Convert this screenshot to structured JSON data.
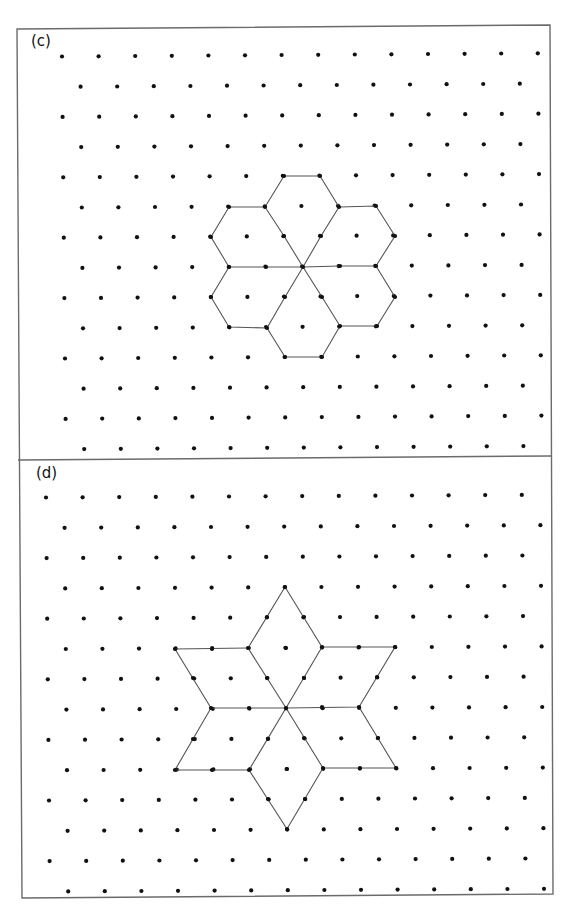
{
  "figure": {
    "border_color": "#6b6b6b",
    "line_color": "#555555",
    "dot_color": "#111111",
    "dot_radius": 2.1,
    "frame": {
      "top_left": [
        17,
        29
      ],
      "top_right": [
        550,
        25
      ],
      "bottom_left": [
        22,
        898
      ],
      "bottom_right": [
        553,
        894
      ],
      "separator": [
        [
          18,
          460
        ],
        [
          551,
          456
        ]
      ]
    }
  },
  "panels": [
    {
      "id": "c",
      "label": "(c)",
      "label_pos": [
        31,
        34
      ],
      "grid": {
        "origin": [
          62,
          56.5
        ],
        "dx": 36.6,
        "dy": 30.2,
        "row_shift": 18.3,
        "drift_x_per_row": 0.3,
        "drift_y_per_col": -0.25,
        "rows": 14,
        "even_cols": 14,
        "odd_cols": 13
      },
      "shape": {
        "name": "six-hexagon-rosette",
        "center": [
          303,
          267
        ],
        "polylines": [
          [
            [
              303,
              267
            ],
            [
              266,
              267
            ],
            [
              229,
              267
            ],
            [
              211,
              237
            ],
            [
              229,
              207
            ],
            [
              265,
              207
            ],
            [
              284,
              236
            ],
            [
              303,
              267
            ]
          ],
          [
            [
              265,
              207
            ],
            [
              284,
              176
            ],
            [
              320,
              176
            ],
            [
              339,
              207
            ],
            [
              321,
              236
            ],
            [
              303,
              267
            ]
          ],
          [
            [
              339,
              207
            ],
            [
              376,
              206
            ],
            [
              395,
              236
            ],
            [
              376,
              266
            ],
            [
              340,
              266
            ],
            [
              303,
              267
            ]
          ],
          [
            [
              376,
              266
            ],
            [
              395,
              297
            ],
            [
              377,
              326
            ],
            [
              340,
              326
            ],
            [
              322,
              297
            ],
            [
              303,
              267
            ]
          ],
          [
            [
              340,
              326
            ],
            [
              322,
              357
            ],
            [
              285,
              357
            ],
            [
              267,
              328
            ],
            [
              285,
              297
            ],
            [
              303,
              267
            ]
          ],
          [
            [
              267,
              328
            ],
            [
              229,
              327
            ],
            [
              211,
              297
            ],
            [
              229,
              267
            ]
          ]
        ],
        "vertex_dots": [
          [
            284,
            176
          ],
          [
            320,
            176
          ],
          [
            229,
            207
          ],
          [
            265,
            207
          ],
          [
            339,
            207
          ],
          [
            376,
            206
          ],
          [
            211,
            237
          ],
          [
            284,
            236
          ],
          [
            321,
            236
          ],
          [
            395,
            236
          ],
          [
            229,
            267
          ],
          [
            266,
            267
          ],
          [
            303,
            267
          ],
          [
            340,
            266
          ],
          [
            376,
            266
          ],
          [
            211,
            297
          ],
          [
            285,
            297
          ],
          [
            322,
            297
          ],
          [
            395,
            297
          ],
          [
            229,
            327
          ],
          [
            267,
            328
          ],
          [
            340,
            326
          ],
          [
            377,
            326
          ],
          [
            285,
            357
          ],
          [
            322,
            357
          ]
        ]
      }
    },
    {
      "id": "d",
      "label": "(d)",
      "label_pos": [
        36,
        466
      ],
      "grid": {
        "origin": [
          46,
          497.5
        ],
        "dx": 36.6,
        "dy": 30.3,
        "row_shift": 18.3,
        "drift_x_per_row": 0.3,
        "drift_y_per_col": -0.2,
        "rows": 14,
        "even_cols": 14,
        "odd_cols": 14
      },
      "shape": {
        "name": "six-rhombus-star",
        "center": [
          286,
          708
        ],
        "polylines": [
          [
            [
              286,
              708
            ],
            [
              248,
              648
            ],
            [
              285,
              587
            ],
            [
              322,
              647
            ],
            [
              286,
              708
            ]
          ],
          [
            [
              322,
              647
            ],
            [
              395,
              647
            ],
            [
              359,
              707
            ],
            [
              286,
              708
            ]
          ],
          [
            [
              359,
              707
            ],
            [
              396,
              768
            ],
            [
              323,
              768
            ],
            [
              286,
              708
            ]
          ],
          [
            [
              323,
              768
            ],
            [
              287,
              829
            ],
            [
              249,
              770
            ],
            [
              286,
              708
            ]
          ],
          [
            [
              249,
              770
            ],
            [
              175,
              770
            ],
            [
              211,
              708
            ],
            [
              286,
              708
            ]
          ],
          [
            [
              211,
              708
            ],
            [
              175,
              649
            ],
            [
              248,
              648
            ]
          ]
        ],
        "vertex_dots": [
          [
            285,
            587
          ],
          [
            267,
            617
          ],
          [
            304,
            617
          ],
          [
            175,
            649
          ],
          [
            212,
            649
          ],
          [
            248,
            648
          ],
          [
            286,
            648
          ],
          [
            322,
            647
          ],
          [
            359,
            647
          ],
          [
            395,
            647
          ],
          [
            193,
            678
          ],
          [
            267,
            678
          ],
          [
            304,
            678
          ],
          [
            377,
            677
          ],
          [
            211,
            708
          ],
          [
            249,
            708
          ],
          [
            286,
            708
          ],
          [
            322,
            707
          ],
          [
            359,
            707
          ],
          [
            193,
            739
          ],
          [
            268,
            739
          ],
          [
            304,
            738
          ],
          [
            378,
            738
          ],
          [
            175,
            770
          ],
          [
            212,
            770
          ],
          [
            249,
            770
          ],
          [
            287,
            769
          ],
          [
            323,
            768
          ],
          [
            360,
            768
          ],
          [
            396,
            768
          ],
          [
            268,
            799
          ],
          [
            305,
            799
          ],
          [
            287,
            829
          ]
        ]
      }
    }
  ]
}
